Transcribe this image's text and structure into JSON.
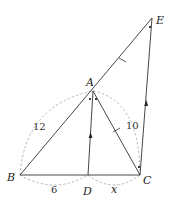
{
  "diagram": {
    "points": {
      "A": {
        "label": "A",
        "x": 93,
        "y": 91
      },
      "B": {
        "label": "B",
        "x": 20,
        "y": 175
      },
      "C": {
        "label": "C",
        "x": 140,
        "y": 175
      },
      "D": {
        "label": "D",
        "x": 88,
        "y": 175
      },
      "E": {
        "label": "E",
        "x": 152,
        "y": 18
      }
    },
    "measurements": {
      "AB": "12",
      "AC": "10",
      "BD": "6",
      "DC": "x"
    },
    "segments": [
      "BA",
      "AE",
      "BC",
      "AD",
      "AC",
      "CE"
    ],
    "markings": {
      "parallel_arrows": [
        "AD",
        "CE"
      ],
      "equal_ticks": [
        "AE",
        "AC"
      ],
      "equal_angle_dots": [
        "BAD",
        "DAC",
        "AEC",
        "ACE"
      ]
    }
  }
}
